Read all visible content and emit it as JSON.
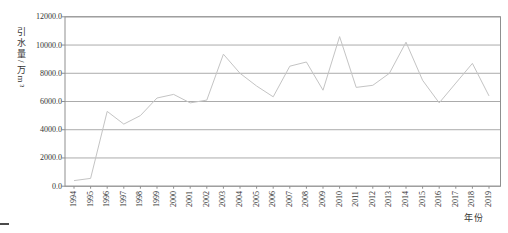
{
  "chart_data": {
    "type": "line",
    "title": "",
    "xlabel": "年份",
    "ylabel": "引水量/万m³",
    "x_labels": [
      "1994",
      "1995",
      "1996",
      "1997",
      "1998",
      "1999",
      "2000",
      "2001",
      "2002",
      "2003",
      "2004",
      "2005",
      "2006",
      "2007",
      "2008",
      "2009",
      "2010",
      "2011",
      "2012",
      "2013",
      "2014",
      "2015",
      "2016",
      "2017",
      "2018",
      "2019"
    ],
    "series": [
      {
        "name": "引水量",
        "values": [
          400,
          550,
          5300,
          4400,
          5000,
          6250,
          6500,
          5900,
          6100,
          9350,
          8000,
          7100,
          6330,
          8500,
          8800,
          6800,
          10600,
          7000,
          7150,
          8000,
          10200,
          7500,
          5900,
          7300,
          8700,
          6400
        ]
      }
    ],
    "ylim": [
      0,
      12000
    ],
    "ytick_step": 2000,
    "ytick_labels": [
      "0.0",
      "2000.0",
      "4000.0",
      "6000.0",
      "8000.0",
      "10000.0",
      "12000.0"
    ],
    "grid": "horizontal",
    "legend": "none",
    "colors": {
      "line": "#c4c4c4",
      "grid": "#ababab",
      "border": "#8f8f8f",
      "text": "#333333",
      "background": "#ffffff"
    }
  }
}
